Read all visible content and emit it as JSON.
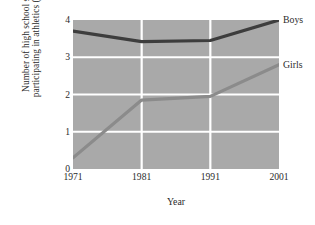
{
  "chart_data": {
    "type": "line",
    "title": "",
    "xlabel": "Year",
    "ylabel_line1": "Number of high school students",
    "ylabel_line2": "participating in athletics (millions)",
    "categories": [
      "1971",
      "1981",
      "1991",
      "2001"
    ],
    "x": [
      1971,
      1981,
      1991,
      2001
    ],
    "xlim": [
      1971,
      2001
    ],
    "ylim": [
      0,
      4
    ],
    "yticks": [
      "4",
      "3",
      "2",
      "1",
      "0"
    ],
    "ytick_values": [
      4,
      3,
      2,
      1,
      0
    ],
    "xticks": [
      "1971",
      "1981",
      "1991",
      "2001"
    ],
    "grid": true,
    "grid_color": "#ffffff",
    "plot_background": "#a9a9a9",
    "page_background": "#ffffff",
    "legend_position": "right-of-line-ends",
    "series": [
      {
        "name": "Boys",
        "values": [
          3.7,
          3.42,
          3.45,
          4.0
        ],
        "color": "#3d3d3d",
        "line_width": 3.2
      },
      {
        "name": "Girls",
        "values": [
          0.3,
          1.85,
          1.95,
          2.8
        ],
        "color": "#8b8b8b",
        "line_width": 3.2
      }
    ]
  }
}
